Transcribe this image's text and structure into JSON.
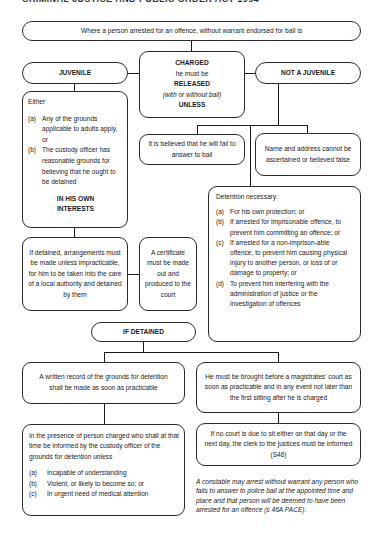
{
  "header": {
    "title": "CRIMINAL JUSTICE AND PUBLIC ORDER ACT 1994"
  },
  "top": {
    "text": "Where a person arrested for an offence, without warrant endorsed for bail is"
  },
  "juvenile": {
    "label": "JUVENILE"
  },
  "charged": {
    "line1": "CHARGED",
    "line2": "he must be",
    "line3": "RELEASED",
    "line4": "(with or without bail)",
    "line5": "UNLESS"
  },
  "not_juvenile": {
    "label": "NOT A JUVENILE"
  },
  "juvenile_grounds": {
    "intro": "Either",
    "items": [
      {
        "label": "(a)",
        "text": "Any of the grounds applicable to adults apply, or"
      },
      {
        "label": "(b)",
        "text": "The custody officer has reasonable grounds for believing that he ought to be detained"
      }
    ],
    "emphasis": "IN HIS OWN INTERESTS"
  },
  "fail_to_answer": {
    "text": "It is believed that he will fail to answer to bail"
  },
  "name_address": {
    "text": "Name and address cannot be ascertained or believed false"
  },
  "detention_necessary": {
    "title": "Detention necessary:",
    "items": [
      {
        "label": "(a)",
        "text": "For his own protection; or"
      },
      {
        "label": "(b)",
        "text": "If arrested for imprisonable offence, to prevent him committing an offence; or"
      },
      {
        "label": "(c)",
        "text": "If arrested for a non-imprison-able offence, to prevent him causing physical injury to another person, or loss of or damage to property; or"
      },
      {
        "label": "(d)",
        "text": "To prevent him interfering with the administration of justice or the investigation of offences"
      }
    ]
  },
  "local_authority": {
    "text": "If detained, arrangements must be made unless impracticable, for him to be taken into the care of a local authority and detained by them"
  },
  "certificate": {
    "text": "A certificate must be made out and produced to the court"
  },
  "if_detained": {
    "label": "IF DETAINED"
  },
  "written_record": {
    "text": "A written record of the grounds for detention shall be made as soon as practicable"
  },
  "magistrates": {
    "text": "He must be brought before a magistrates' court as soon as practicable and in any event not later than the first sitting after he is charged"
  },
  "presence": {
    "intro": "In the presence of person charged who shall at that time be informed by the custody officer of the grounds for detention unless",
    "items": [
      {
        "label": "(a)",
        "text": "Incapable of understanding"
      },
      {
        "label": "(b)",
        "text": "Violent, or likely to become so; or"
      },
      {
        "label": "(c)",
        "text": "In urgent need of medical attention"
      }
    ]
  },
  "no_court": {
    "text": "If no court is due to sit either on that day or the next day, the clerk to the justices must be informed (S46)"
  },
  "footnote": {
    "text": "A constable may arrest without warrant any person who fails to answer to police bail at the appointed time and place and that person will be deemed to have been arrested for an offence (s 46A PACE)."
  }
}
